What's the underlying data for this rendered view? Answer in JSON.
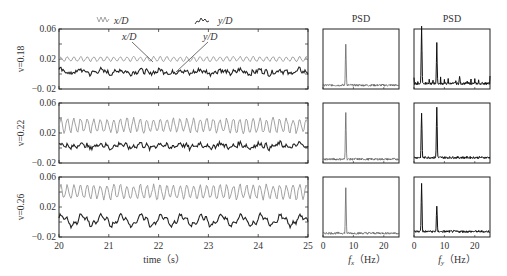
{
  "chart_data": [
    {
      "type": "line",
      "title": "",
      "xlabel": "time (s)",
      "ylabel": "v=0.18",
      "xlim": [
        20,
        25
      ],
      "ylim": [
        -0.02,
        0.06
      ],
      "x_ticks": [
        "20",
        "21",
        "22",
        "23",
        "24",
        "25"
      ],
      "y_ticks": [
        "0.06",
        "0.02",
        "-0.02"
      ],
      "legend": [
        "x/D",
        "y/D"
      ],
      "annotations": [
        "x/D",
        "y/D"
      ],
      "series": [
        {
          "name": "x/D",
          "color": "#999999",
          "mean": 0.02,
          "amplitude": 0.003,
          "freq_hz": 7.5
        },
        {
          "name": "y/D",
          "color": "#222222",
          "mean": 0.003,
          "amplitude": 0.005,
          "freq_hz": "broadband"
        }
      ]
    },
    {
      "type": "line",
      "ylabel": "v=0.22",
      "xlim": [
        20,
        25
      ],
      "ylim": [
        -0.02,
        0.06
      ],
      "y_ticks": [
        "0.06",
        "0.02",
        "-0.02"
      ],
      "series": [
        {
          "name": "x/D",
          "color": "#999999",
          "mean": 0.03,
          "amplitude": 0.009,
          "freq_hz": 7.5
        },
        {
          "name": "y/D",
          "color": "#222222",
          "mean": 0.003,
          "amplitude": 0.006,
          "freq_hz": "broadband"
        }
      ]
    },
    {
      "type": "line",
      "ylabel": "v=0.26",
      "xlim": [
        20,
        25
      ],
      "ylim": [
        -0.02,
        0.06
      ],
      "y_ticks": [
        "0.06",
        "0.02",
        "-0.02"
      ],
      "series": [
        {
          "name": "x/D",
          "color": "#999999",
          "mean": 0.04,
          "amplitude": 0.009,
          "freq_hz": 7.5
        },
        {
          "name": "y/D",
          "color": "#222222",
          "mean": 0.002,
          "amplitude": 0.01,
          "freq_hz": 2.5
        }
      ]
    },
    {
      "type": "line",
      "title": "PSD",
      "xlabel": "f_x (Hz)",
      "xlim": [
        0,
        25
      ],
      "x_ticks": [
        "0",
        "10",
        "20"
      ],
      "rows": [
        {
          "v": 0.18,
          "peaks": [
            {
              "f": 7.5,
              "rel_height": 0.75
            }
          ]
        },
        {
          "v": 0.22,
          "peaks": [
            {
              "f": 7.5,
              "rel_height": 0.85
            }
          ]
        },
        {
          "v": 0.26,
          "peaks": [
            {
              "f": 7.5,
              "rel_height": 0.8
            }
          ]
        }
      ]
    },
    {
      "type": "line",
      "title": "PSD",
      "xlabel": "f_y (Hz)",
      "xlim": [
        0,
        25
      ],
      "x_ticks": [
        "0",
        "10",
        "20"
      ],
      "rows": [
        {
          "v": 0.18,
          "peaks": [
            {
              "f": 2.5,
              "rel_height": 0.95
            },
            {
              "f": 7.5,
              "rel_height": 0.6
            },
            {
              "f": 15,
              "rel_height": 0.1
            }
          ]
        },
        {
          "v": 0.22,
          "peaks": [
            {
              "f": 2.5,
              "rel_height": 0.8
            },
            {
              "f": 7.5,
              "rel_height": 0.9
            }
          ]
        },
        {
          "v": 0.26,
          "peaks": [
            {
              "f": 2.5,
              "rel_height": 0.85
            },
            {
              "f": 7.5,
              "rel_height": 0.45
            }
          ]
        }
      ]
    }
  ],
  "labels": {
    "legend_x": "x/D",
    "legend_y": "y/D",
    "anno_x": "x/D",
    "anno_y": "y/D",
    "psd_title_1": "PSD",
    "psd_title_2": "PSD",
    "row_labels": [
      "v=0.18",
      "v=0.22",
      "v=0.26"
    ],
    "y_ticks": [
      "0.06",
      "0.02",
      "-0.02"
    ],
    "time_ticks": [
      "20",
      "21",
      "22",
      "23",
      "24",
      "25"
    ],
    "freq_ticks": [
      "0",
      "10",
      "20"
    ],
    "time_label": "time（s）",
    "fx_label_f": "f",
    "fx_label_sub": "x",
    "fx_label_unit": "（Hz）",
    "fy_label_f": "f",
    "fy_label_sub": "y",
    "fy_label_unit": "（Hz）"
  }
}
